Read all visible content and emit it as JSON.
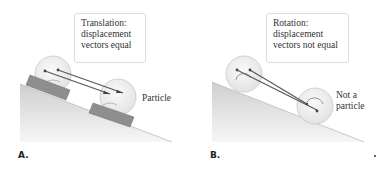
{
  "figure": {
    "panels": [
      {
        "letter": "A.",
        "callout": [
          "Translation:",
          "displacement",
          "vectors equal"
        ],
        "side_label": [
          "Particle"
        ],
        "motion": "translation"
      },
      {
        "letter": "B.",
        "callout": [
          "Rotation:",
          "displacement",
          "vectors not equal"
        ],
        "side_label": [
          "Not a",
          "particle"
        ],
        "motion": "rotation"
      }
    ],
    "colors": {
      "incline_fill": "#d9d9d9",
      "block_fill": "#8c8c8c",
      "disk_fill": "#eeeeee",
      "vector": "#555555",
      "callout_border": "#dcdcdc"
    }
  }
}
